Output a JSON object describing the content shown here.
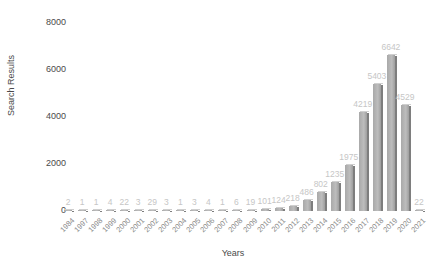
{
  "chart_data": {
    "type": "bar",
    "title": "",
    "xlabel": "Years",
    "ylabel": "Search Results",
    "ylim": [
      0,
      8000
    ],
    "yticks": [
      0,
      2000,
      4000,
      6000,
      8000
    ],
    "grid": false,
    "legend": null,
    "categories": [
      "1984",
      "1997",
      "1998",
      "1999",
      "2000",
      "2001",
      "2002",
      "2003",
      "2004",
      "2005",
      "2006",
      "2007",
      "2008",
      "2009",
      "2010",
      "2011",
      "2012",
      "2013",
      "2014",
      "2015",
      "2016",
      "2017",
      "2018",
      "2019",
      "2020",
      "2021"
    ],
    "values": [
      2,
      1,
      1,
      4,
      22,
      3,
      29,
      3,
      1,
      3,
      4,
      1,
      6,
      19,
      101,
      124,
      218,
      486,
      802,
      1235,
      1975,
      4219,
      5403,
      6642,
      4529,
      22
    ],
    "bar_color": "#b0b0b0",
    "label_color": "#c6c6c6"
  },
  "axes": {
    "ylabel": "Search Results",
    "xlabel": "Years",
    "yticks": [
      "8000",
      "6000",
      "4000",
      "2000",
      "0"
    ]
  }
}
